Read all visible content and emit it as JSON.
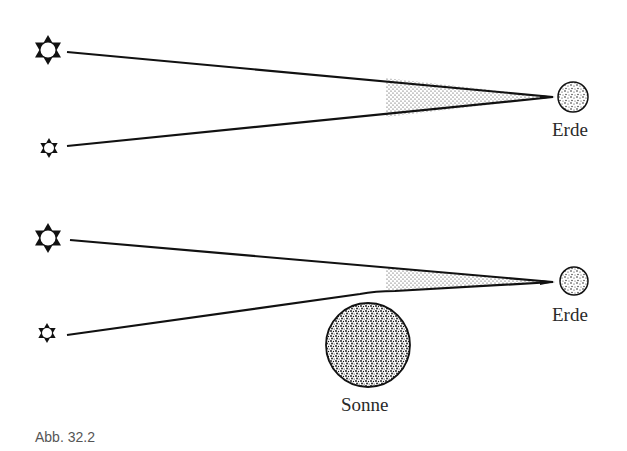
{
  "figure": {
    "caption": "Abb. 32.2",
    "panels": [
      {
        "id": "without-sun",
        "earth_label": "Erde",
        "stars": [
          "large-star",
          "small-star"
        ]
      },
      {
        "id": "with-sun",
        "earth_label": "Erde",
        "sun_label": "Sonne",
        "stars": [
          "large-star",
          "small-star"
        ]
      }
    ]
  },
  "colors": {
    "ink": "#111111",
    "label": "#2a2a2a",
    "caption": "#555555",
    "background": "#ffffff"
  }
}
